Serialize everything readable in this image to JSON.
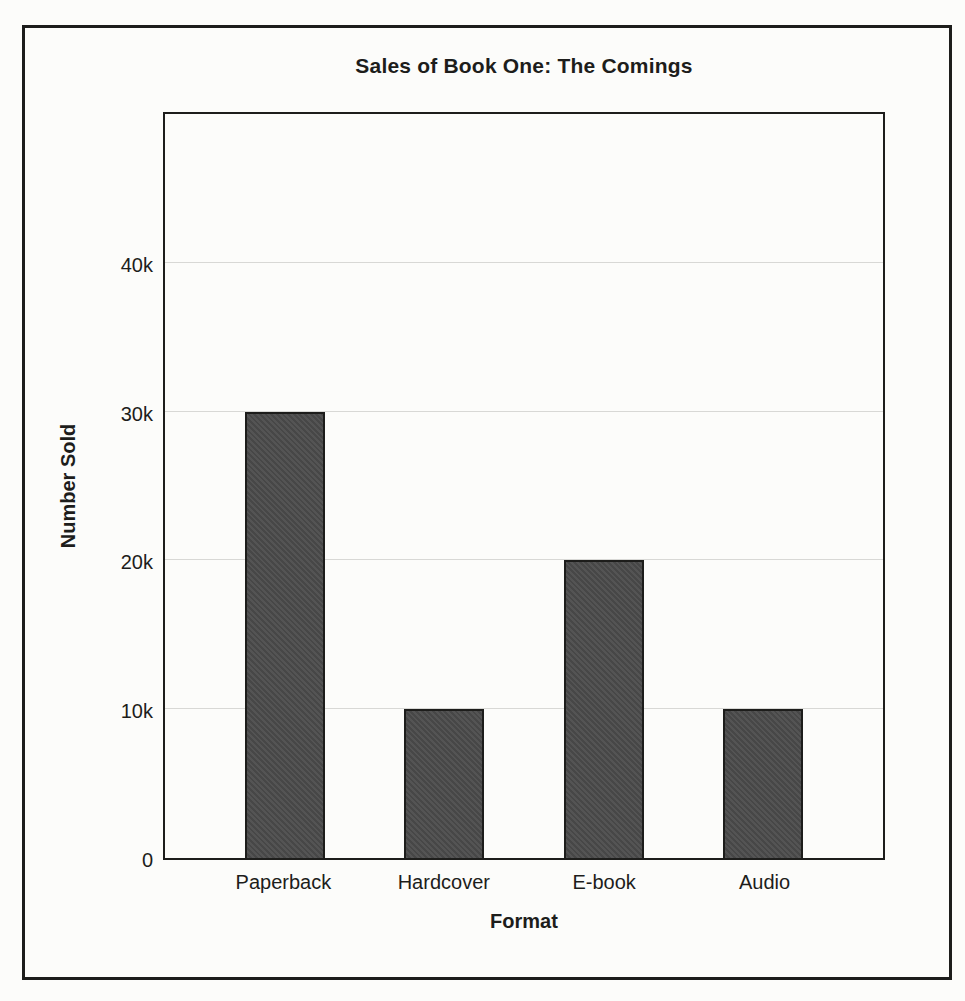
{
  "chart_data": {
    "type": "bar",
    "title": "Sales of Book One: The Comings",
    "xlabel": "Format",
    "ylabel": "Number Sold",
    "categories": [
      "Paperback",
      "Hardcover",
      "E-book",
      "Audio"
    ],
    "values": [
      30000,
      10000,
      20000,
      10000
    ],
    "ylim": [
      0,
      50000
    ],
    "yticks": [
      {
        "value": 0,
        "label": "0"
      },
      {
        "value": 10000,
        "label": "10k"
      },
      {
        "value": 20000,
        "label": "20k"
      },
      {
        "value": 30000,
        "label": "30k"
      },
      {
        "value": 40000,
        "label": "40k"
      }
    ],
    "grid": true,
    "legend": false,
    "colors": {
      "bar_fill": "#4b4b4b",
      "bar_border": "#1d1d1b",
      "gridline": "#d8d8d5",
      "ink": "#1d1d1b",
      "paper": "#fcfcfa"
    }
  }
}
